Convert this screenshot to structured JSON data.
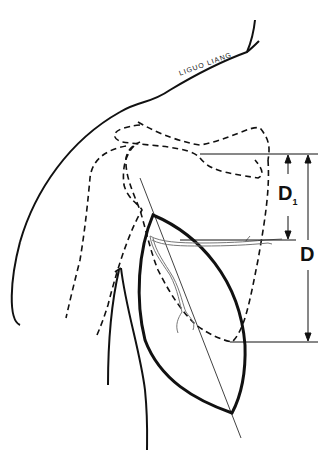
{
  "diagram": {
    "signature": "LIGUO LIANG",
    "labels": {
      "d1": "D",
      "d1_sub": "1",
      "d": "D"
    },
    "colors": {
      "ink": "#111111",
      "vessel": "#777777",
      "background": "#ffffff"
    }
  }
}
